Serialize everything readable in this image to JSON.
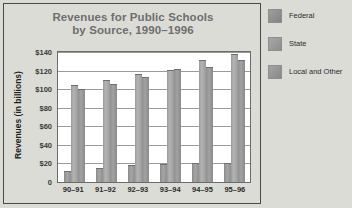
{
  "chart_data": {
    "type": "bar",
    "title": "Revenues for Public Schools by Source, 1990–1996",
    "title_line1": "Revenues for Public Schools",
    "title_line2": "by Source, 1990–1996",
    "xlabel": "",
    "ylabel": "Revenues (in billions)",
    "ylim": [
      0,
      140
    ],
    "ytick_step": 20,
    "ytick_labels": [
      "$140",
      "$120",
      "$100",
      "$80",
      "$60",
      "$40",
      "$20",
      "0"
    ],
    "ytick_values": [
      140,
      120,
      100,
      80,
      60,
      40,
      20,
      0
    ],
    "grid": true,
    "legend_position": "right",
    "categories": [
      "90–91",
      "91–92",
      "92–93",
      "93–94",
      "94–95",
      "95–96"
    ],
    "series": [
      {
        "name": "Federal",
        "color": "#989898",
        "values": [
          12,
          15,
          18,
          19,
          20,
          21
        ]
      },
      {
        "name": "State",
        "color": "#a8a8a8",
        "values": [
          105,
          110,
          116,
          121,
          131,
          138
        ]
      },
      {
        "name": "Local and Other",
        "color": "#969696",
        "values": [
          100,
          106,
          113,
          122,
          124,
          131
        ]
      }
    ]
  },
  "legend": {
    "items": [
      {
        "label": "Federal",
        "swatch": "legend-swatch-federal"
      },
      {
        "label": "State",
        "swatch": "legend-swatch-state"
      },
      {
        "label": "Local and Other",
        "swatch": "legend-swatch-local-and-other"
      }
    ]
  }
}
